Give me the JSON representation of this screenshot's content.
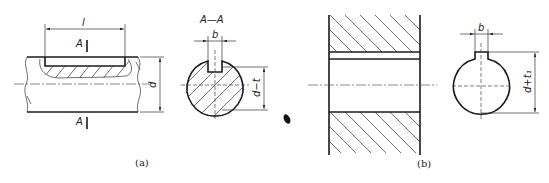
{
  "figure_a": {
    "caption": "(a)",
    "shaft_view": {
      "length_label": "l",
      "section_mark_top": "A",
      "section_mark_bottom": "A",
      "diameter_label": "d"
    },
    "section_view": {
      "title": "A—A",
      "width_label": "b",
      "depth_label": "d−t"
    }
  },
  "figure_b": {
    "caption": "(b)",
    "section_view": {
      "width_label": "b",
      "depth_label": "d+t₁"
    }
  },
  "colors": {
    "line": "#1a1a1a",
    "background": "#ffffff"
  }
}
